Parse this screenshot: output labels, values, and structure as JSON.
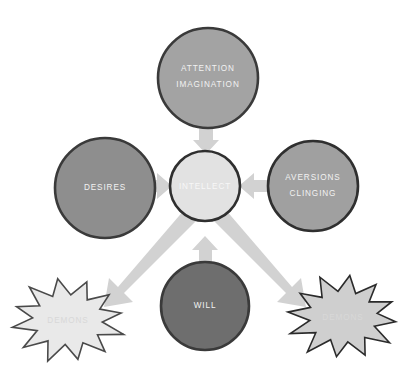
{
  "diagram": {
    "background_color": "#ffffff",
    "arrow_color": "#d2d2d2",
    "nodes": {
      "attention": {
        "label_line1": "ATTENTION",
        "label_line2": "IMAGINATION",
        "shape": "circle",
        "fill": "#a3a3a3",
        "stroke": "#3a3a3a",
        "cx": 208,
        "cy": 78,
        "r": 50
      },
      "desires": {
        "label_line1": "DESIRES",
        "shape": "circle",
        "fill": "#8e8e8e",
        "stroke": "#3a3a3a",
        "cx": 105,
        "cy": 188,
        "r": 50
      },
      "intellect": {
        "label_line1": "INTELLECT",
        "shape": "circle",
        "fill": "#e2e2e2",
        "stroke": "#2f2f2f",
        "cx": 205,
        "cy": 186,
        "r": 35
      },
      "aversions": {
        "label_line1": "AVERSIONS",
        "label_line2": "CLINGING",
        "shape": "circle",
        "fill": "#a0a0a0",
        "stroke": "#2f2f2f",
        "cx": 313,
        "cy": 186,
        "r": 45
      },
      "will": {
        "label_line1": "WILL",
        "shape": "circle",
        "fill": "#6e6e6e",
        "stroke": "#3a3a3a",
        "cx": 205,
        "cy": 306,
        "r": 44
      },
      "demons_left": {
        "label_line1": "DEMONS",
        "shape": "starburst",
        "fill": "#e9e9e9",
        "stroke": "#4a4a4a",
        "cx": 68,
        "cy": 320,
        "rx": 58,
        "ry": 42,
        "points": 12
      },
      "demons_right": {
        "label_line1": "DEMONS",
        "shape": "starburst",
        "fill": "#cfcfcf",
        "stroke": "#2b2b2b",
        "cx": 343,
        "cy": 317,
        "rx": 57,
        "ry": 42,
        "points": 12
      }
    },
    "arrows": [
      {
        "name": "attention-to-intellect",
        "direction": "down",
        "from": "attention",
        "to": "intellect"
      },
      {
        "name": "desires-to-intellect",
        "direction": "right",
        "from": "desires",
        "to": "intellect"
      },
      {
        "name": "aversions-to-intellect",
        "direction": "left",
        "from": "aversions",
        "to": "intellect"
      },
      {
        "name": "will-to-intellect",
        "direction": "up",
        "from": "will",
        "to": "intellect"
      },
      {
        "name": "intellect-to-demons-left",
        "direction": "down-left",
        "from": "intellect",
        "to": "demons_left"
      },
      {
        "name": "intellect-to-demons-right",
        "direction": "down-right",
        "from": "intellect",
        "to": "demons_right"
      }
    ]
  }
}
